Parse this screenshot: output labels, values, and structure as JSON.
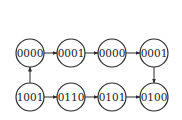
{
  "diagram": {
    "type": "state-transition",
    "nodes": [
      {
        "id": "n1",
        "label": "0000",
        "row": "top",
        "col": 0
      },
      {
        "id": "n2",
        "label": "0001",
        "row": "top",
        "col": 1
      },
      {
        "id": "n3",
        "label": "0000",
        "row": "top",
        "col": 2
      },
      {
        "id": "n4",
        "label": "0001",
        "row": "top",
        "col": 3
      },
      {
        "id": "n5",
        "label": "1001",
        "row": "bottom",
        "col": 0
      },
      {
        "id": "n6",
        "label": "0110",
        "row": "bottom",
        "col": 1
      },
      {
        "id": "n7",
        "label": "0101",
        "row": "bottom",
        "col": 2
      },
      {
        "id": "n8",
        "label": "0100",
        "row": "bottom",
        "col": 3
      }
    ],
    "edges": [
      {
        "from": "n1",
        "to": "n2"
      },
      {
        "from": "n2",
        "to": "n3"
      },
      {
        "from": "n3",
        "to": "n4"
      },
      {
        "from": "n4",
        "to": "n8"
      },
      {
        "from": "n5",
        "to": "n1"
      },
      {
        "from": "n5",
        "to": "n6"
      },
      {
        "from": "n6",
        "to": "n7"
      },
      {
        "from": "n7",
        "to": "n8"
      }
    ],
    "colors": {
      "stroke": "#2a2a2a",
      "fill": "#ffffff",
      "text": "#1a1a1a"
    }
  }
}
